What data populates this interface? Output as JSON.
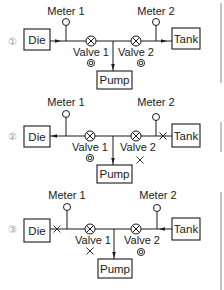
{
  "diagrams": [
    {
      "index": "①",
      "die": "Die",
      "tank": "Tank",
      "pump": "Pump",
      "meter1": "Meter 1",
      "meter2": "Meter 2",
      "valve1": "Valve 1",
      "valve2": "Valve 2",
      "valve1_state": "open (◎)",
      "valve2_state": "open (◎)",
      "die_line_state": "flow arrow toward junction",
      "tank_line_state": "flow arrow toward tank"
    },
    {
      "index": "②",
      "die": "Die",
      "tank": "Tank",
      "pump": "Pump",
      "meter1": "Meter 1",
      "meter2": "Meter 2",
      "valve1": "Valve 1",
      "valve2": "Valve 2",
      "valve1_state": "open (◎)",
      "valve2_state": "closed (×)",
      "die_line_state": "flow arrow toward die",
      "tank_line_state": "blocked (×)"
    },
    {
      "index": "③",
      "die": "Die",
      "tank": "Tank",
      "pump": "Pump",
      "meter1": "Meter 1",
      "meter2": "Meter 2",
      "valve1": "Valve 1",
      "valve2": "Valve 2",
      "valve1_state": "closed (×)",
      "valve2_state": "open (◎)",
      "die_line_state": "blocked (×)",
      "tank_line_state": "flow arrow toward junction"
    }
  ],
  "symbols": {
    "open": "◎",
    "closed": "×"
  },
  "colors": {
    "line": "#1a1a1a",
    "index_number": "#9a9a9a",
    "background": "#ffffff"
  }
}
